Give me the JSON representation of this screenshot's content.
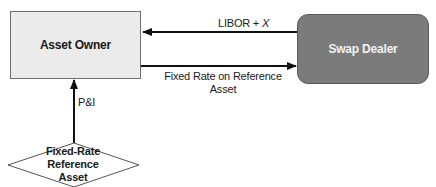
{
  "diagram": {
    "type": "flowchart",
    "nodes": {
      "asset_owner": {
        "label": "Asset Owner",
        "shape": "rectangle",
        "fill": "#ebebeb"
      },
      "swap_dealer": {
        "label": "Swap Dealer",
        "shape": "rounded-rectangle",
        "fill": "#7b7b7b"
      },
      "reference_asset": {
        "label_lines": [
          "Fixed-Rate",
          "Reference",
          "Asset"
        ],
        "shape": "diamond",
        "fill": "#ffffff"
      }
    },
    "edges": {
      "libor": {
        "from": "Swap Dealer",
        "to": "Asset Owner",
        "label_prefix": "LIBOR + ",
        "label_variable": "X"
      },
      "fixed_rate": {
        "from": "Asset Owner",
        "to": "Swap Dealer",
        "label_lines": [
          "Fixed Rate on Reference",
          "Asset"
        ]
      },
      "pi": {
        "from": "Fixed-Rate Reference Asset",
        "to": "Asset Owner",
        "label": "P&I"
      }
    },
    "colors": {
      "line": "#111111",
      "text": "#1a1a1a",
      "dealer_text": "#f2f2f2"
    }
  }
}
